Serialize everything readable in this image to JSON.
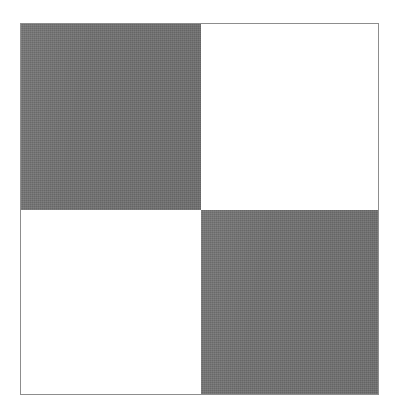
{
  "figure": {
    "border_color": "#8d8d8d",
    "dark_color": "#6f6f6f",
    "light_color": "#ffffff",
    "background_color": "#ffffff",
    "frame": {
      "left": 20,
      "top": 23,
      "width": 359,
      "height": 372
    },
    "grid": {
      "rows": 2,
      "columns": 2,
      "column_widths": [
        180,
        177
      ],
      "row_heights": [
        186,
        184
      ],
      "split_x": 200,
      "split_y": 209
    },
    "cells": [
      {
        "position": "top-left",
        "row": 0,
        "column": 0,
        "fill": "dark",
        "color": "#6f6f6f"
      },
      {
        "position": "top-right",
        "row": 0,
        "column": 1,
        "fill": "light",
        "color": "#ffffff"
      },
      {
        "position": "bottom-left",
        "row": 1,
        "column": 0,
        "fill": "light",
        "color": "#ffffff"
      },
      {
        "position": "bottom-right",
        "row": 1,
        "column": 1,
        "fill": "dark",
        "color": "#6f6f6f"
      }
    ]
  }
}
